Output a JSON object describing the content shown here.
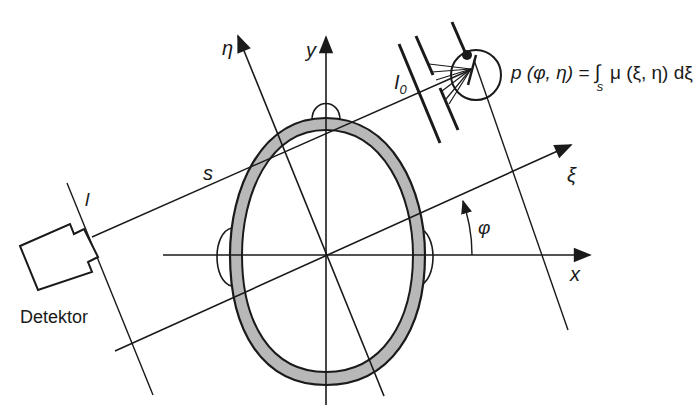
{
  "diagram": {
    "type": "CT projection geometry (head cross-section)",
    "axes": {
      "x": "x",
      "y": "y",
      "xi": "ξ",
      "eta": "η"
    },
    "angle_label": "φ",
    "ray_label": "s",
    "detector_line_label": "l",
    "source_intensity_label": "I",
    "source_intensity_subscript": "0",
    "detector_label": "Detektor",
    "formula": {
      "lhs": "p (φ, η) =",
      "integral": "∫",
      "integral_subscript": "s",
      "rhs": "μ (ξ, η) dξ"
    }
  },
  "colors": {
    "ink": "#1a1a1a",
    "skull_fill": "#b8b8b8",
    "background": "#ffffff"
  }
}
